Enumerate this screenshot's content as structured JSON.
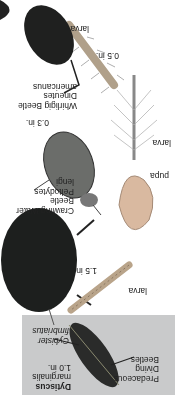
{
  "panel": {
    "group_title": [
      "Predaceous",
      "Diving",
      "Beetles"
    ],
    "dytiscus": {
      "genus": "Dytiscus",
      "species": "marginalis",
      "size": "1.0 in."
    },
    "cybister": {
      "genus": "Cybister",
      "species": "fimbriatus",
      "size": "1.5 in."
    },
    "dytiscus_larva_label": "larva",
    "pupa_label": "pupa",
    "crawling": {
      "name1": "Crawling Water",
      "name2": "Beetle",
      "genus": "Peltodytes",
      "species": "lengi",
      "size": "0.3 in."
    },
    "crawling_larva_label": "larva",
    "whirligig": {
      "name": "Whirligig Beetle",
      "genus": "Dineutes",
      "species": "americanus",
      "size": "0.5 in."
    },
    "whirligig_larva_label": "larva"
  },
  "colors": {
    "panel_gray": "#c9cacb",
    "beetle_dark": "#1d1f1e",
    "larva_tan": "#b9a48a"
  }
}
